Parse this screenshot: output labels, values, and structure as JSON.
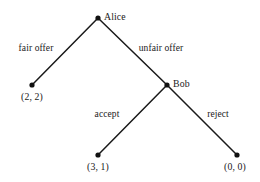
{
  "diagram": {
    "type": "extensive-form-game-tree",
    "title": "",
    "background_color": "#ffffff",
    "line_color": "#191919",
    "node_color": "#111111",
    "text_color": "#1a1a1a",
    "nodes": [
      {
        "id": "alice",
        "label": "Alice",
        "kind": "decision",
        "x": 98,
        "y": 18,
        "label_x": 104,
        "label_y": 12
      },
      {
        "id": "bob",
        "label": "Bob",
        "kind": "decision",
        "x": 167,
        "y": 85,
        "label_x": 173,
        "label_y": 79
      },
      {
        "id": "payoff_fair",
        "label": "(2, 2)",
        "kind": "terminal",
        "x": 32,
        "y": 85,
        "label_x": 32,
        "label_y": 92
      },
      {
        "id": "payoff_accept",
        "label": "(3, 1)",
        "kind": "terminal",
        "x": 98,
        "y": 155,
        "label_x": 98,
        "label_y": 162
      },
      {
        "id": "payoff_reject",
        "label": "(0, 0)",
        "kind": "terminal",
        "x": 237,
        "y": 155,
        "label_x": 235,
        "label_y": 162
      }
    ],
    "edges": [
      {
        "id": "edge-fair-offer",
        "from": "alice",
        "to": "payoff_fair",
        "label": "fair offer",
        "label_x": 36,
        "label_y": 44
      },
      {
        "id": "edge-unfair-offer",
        "from": "alice",
        "to": "bob",
        "label": "unfair offer",
        "label_x": 161,
        "label_y": 44
      },
      {
        "id": "edge-accept",
        "from": "bob",
        "to": "payoff_accept",
        "label": "accept",
        "label_x": 107,
        "label_y": 110
      },
      {
        "id": "edge-reject",
        "from": "bob",
        "to": "payoff_reject",
        "label": "reject",
        "label_x": 218,
        "label_y": 110
      }
    ]
  }
}
